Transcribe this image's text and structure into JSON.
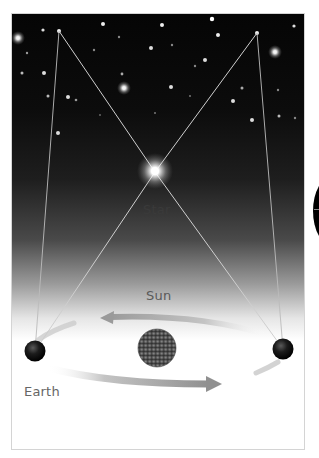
{
  "diagram": {
    "labels": {
      "star": "Star",
      "sun": "Sun",
      "earth": "Earth"
    },
    "colors": {
      "sky_top": "#050505",
      "sky_bottom": "#ffffff",
      "sight_line": "#bdbdbd",
      "orbit_arrow": "#a8a8a8",
      "earth": "#1a1a1a",
      "sun": "#555555"
    },
    "elements": {
      "nearby_star": {
        "x": 155,
        "y": 172
      },
      "earth_left": {
        "x": 35,
        "y": 351
      },
      "earth_right": {
        "x": 283,
        "y": 349
      },
      "sun": {
        "x": 157,
        "y": 348
      },
      "background_star_left": {
        "x": 59,
        "y": 31
      },
      "background_star_right": {
        "x": 257,
        "y": 33
      }
    }
  }
}
